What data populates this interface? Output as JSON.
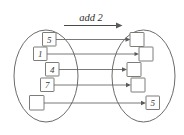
{
  "diagram": {
    "title": "add 2",
    "operation_label": "add 2",
    "type": "function-mapping",
    "colors": {
      "stroke": "#5a5a58",
      "box_stroke": "#6d6d69",
      "text": "#3a3a38",
      "background": "#ffffff"
    },
    "domain_set": {
      "name": "input-set",
      "items": [
        {
          "label": "5",
          "empty": false
        },
        {
          "label": "1",
          "empty": false
        },
        {
          "label": "4",
          "empty": false
        },
        {
          "label": "7",
          "empty": false
        },
        {
          "label": "",
          "empty": true
        }
      ]
    },
    "codomain_set": {
      "name": "output-set",
      "items": [
        {
          "label": "",
          "empty": true
        },
        {
          "label": "",
          "empty": true
        },
        {
          "label": "",
          "empty": true
        },
        {
          "label": "",
          "empty": true
        },
        {
          "label": "5",
          "empty": false
        }
      ]
    },
    "mappings": [
      {
        "from": "5",
        "to": ""
      },
      {
        "from": "1",
        "to": ""
      },
      {
        "from": "4",
        "to": ""
      },
      {
        "from": "7",
        "to": ""
      },
      {
        "from": "",
        "to": "5"
      }
    ]
  }
}
